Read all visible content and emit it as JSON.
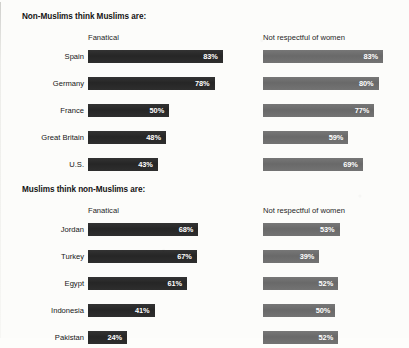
{
  "chart_data": {
    "type": "bar",
    "title": "",
    "orientation": "horizontal",
    "xlabel": "",
    "ylabel": "",
    "xlim": [
      0,
      100
    ],
    "grid": false,
    "legend": "none",
    "value_suffix": "%",
    "colors": {
      "fanatical_bar": "#2b2b2b",
      "not_respectful_bar": "#6d6d6d",
      "value_label": "#ffffff",
      "text": "#161616",
      "background": "#fcfcfa"
    },
    "panels": [
      {
        "heading": "Non-Muslims think Muslims are:",
        "columns": [
          "Fanatical",
          "Not respectful of women"
        ],
        "categories": [
          "Spain",
          "Germany",
          "France",
          "Great Britain",
          "U.S."
        ],
        "series": [
          {
            "name": "Fanatical",
            "values": [
              83,
              78,
              50,
              48,
              43
            ]
          },
          {
            "name": "Not respectful of women",
            "values": [
              83,
              80,
              77,
              59,
              69
            ]
          }
        ]
      },
      {
        "heading": "Muslims think non-Muslims are:",
        "columns": [
          "Fanatical",
          "Not respectful of women"
        ],
        "categories": [
          "Jordan",
          "Turkey",
          "Egypt",
          "Indonesia",
          "Pakistan"
        ],
        "series": [
          {
            "name": "Fanatical",
            "values": [
              68,
              67,
              61,
              41,
              24
            ]
          },
          {
            "name": "Not respectful of women",
            "values": [
              53,
              39,
              52,
              50,
              52
            ]
          }
        ]
      }
    ]
  },
  "panels": [
    {
      "heading": "Non-Muslims think Muslims are:",
      "header_left": "Fanatical",
      "header_right": "Not respectful of women",
      "rows": [
        {
          "label": "Spain",
          "left_value": 83,
          "left_label": "83%",
          "right_value": 83,
          "right_label": "83%"
        },
        {
          "label": "Germany",
          "left_value": 78,
          "left_label": "78%",
          "right_value": 80,
          "right_label": "80%"
        },
        {
          "label": "France",
          "left_value": 50,
          "left_label": "50%",
          "right_value": 77,
          "right_label": "77%"
        },
        {
          "label": "Great Britain",
          "left_value": 48,
          "left_label": "48%",
          "right_value": 59,
          "right_label": "59%"
        },
        {
          "label": "U.S.",
          "left_value": 43,
          "left_label": "43%",
          "right_value": 69,
          "right_label": "69%"
        }
      ]
    },
    {
      "heading": "Muslims think non-Muslims are:",
      "header_left": "Fanatical",
      "header_right": "Not respectful of women",
      "rows": [
        {
          "label": "Jordan",
          "left_value": 68,
          "left_label": "68%",
          "right_value": 53,
          "right_label": "53%"
        },
        {
          "label": "Turkey",
          "left_value": 67,
          "left_label": "67%",
          "right_value": 39,
          "right_label": "39%"
        },
        {
          "label": "Egypt",
          "left_value": 61,
          "left_label": "61%",
          "right_value": 52,
          "right_label": "52%"
        },
        {
          "label": "Indonesia",
          "left_value": 41,
          "left_label": "41%",
          "right_value": 50,
          "right_label": "50%"
        },
        {
          "label": "Pakistan",
          "left_value": 24,
          "left_label": "24%",
          "right_value": 52,
          "right_label": "52%"
        }
      ]
    }
  ]
}
